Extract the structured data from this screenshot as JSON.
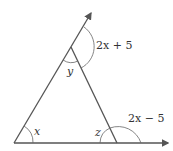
{
  "diagram": {
    "type": "triangle with exterior angles",
    "colors": {
      "line": "#555555",
      "arc": "#666666",
      "text": "#333333"
    },
    "labels": {
      "angle_x": "x",
      "angle_y": "y",
      "angle_z": "z",
      "exterior_top": "2x + 5",
      "exterior_right": "2x − 5"
    }
  }
}
